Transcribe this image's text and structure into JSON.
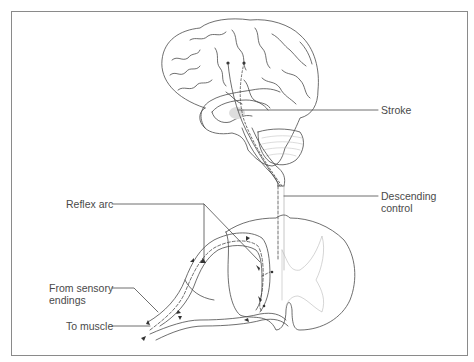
{
  "diagram": {
    "labels": {
      "stroke": "Stroke",
      "descending_control_line1": "Descending",
      "descending_control_line2": "control",
      "reflex_arc": "Reflex arc",
      "from_sensory_line1": "From sensory",
      "from_sensory_line2": "endings",
      "to_muscle": "To muscle"
    },
    "structures": [
      "brain",
      "cerebellum",
      "brainstem",
      "spinal-cord-cross-section",
      "dorsal-root",
      "ventral-root",
      "spinal-nerve"
    ],
    "colors": {
      "line": "#4a4a4a",
      "light_line": "#b8b8b8",
      "frame": "#8a8a8a",
      "background": "#ffffff"
    }
  }
}
